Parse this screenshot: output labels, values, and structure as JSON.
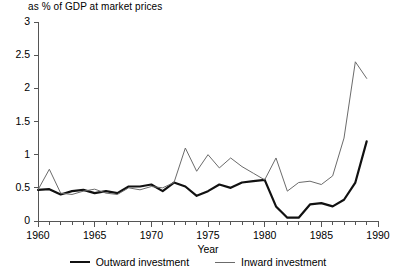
{
  "chart_data": {
    "type": "line",
    "title": "as % of GDP at market prices",
    "xlabel": "Year",
    "ylabel": "",
    "xlim": [
      1960,
      1990
    ],
    "ylim": [
      0,
      3
    ],
    "yticks": [
      "0",
      "0.5",
      "1",
      "1.5",
      "2",
      "2.5",
      "3"
    ],
    "ytick_values": [
      0,
      0.5,
      1,
      1.5,
      2,
      2.5,
      3
    ],
    "xticks": [
      "1960",
      "1965",
      "1970",
      "1975",
      "1980",
      "1985",
      "1990"
    ],
    "xtick_values": [
      1960,
      1965,
      1970,
      1975,
      1980,
      1985,
      1990
    ],
    "minor_xticks": "every year",
    "grid": false,
    "legend_position": "below",
    "x": [
      1960,
      1961,
      1962,
      1963,
      1964,
      1965,
      1966,
      1967,
      1968,
      1969,
      1970,
      1971,
      1972,
      1973,
      1974,
      1975,
      1976,
      1977,
      1978,
      1979,
      1980,
      1981,
      1982,
      1983,
      1984,
      1985,
      1986,
      1987,
      1988,
      1989
    ],
    "series": [
      {
        "name": "Outward investment",
        "color": "#111111",
        "width": 2.2,
        "values": [
          0.47,
          0.48,
          0.4,
          0.45,
          0.47,
          0.42,
          0.45,
          0.42,
          0.52,
          0.52,
          0.55,
          0.45,
          0.58,
          0.52,
          0.38,
          0.45,
          0.55,
          0.5,
          0.58,
          0.6,
          0.62,
          0.22,
          0.05,
          0.05,
          0.25,
          0.27,
          0.22,
          0.32,
          0.58,
          1.2
        ]
      },
      {
        "name": "Inward investment",
        "color": "#6b6b6b",
        "width": 1.0,
        "values": [
          0.47,
          0.78,
          0.42,
          0.4,
          0.45,
          0.48,
          0.42,
          0.4,
          0.5,
          0.47,
          0.52,
          0.5,
          0.58,
          1.1,
          0.75,
          1.0,
          0.8,
          0.95,
          0.82,
          0.72,
          0.62,
          0.95,
          0.45,
          0.58,
          0.6,
          0.55,
          0.68,
          1.25,
          2.4,
          2.15
        ]
      }
    ],
    "legend": [
      {
        "label": "Outward investment",
        "style": "thick-black-line"
      },
      {
        "label": "Inward investment",
        "style": "thin-grey-line"
      }
    ]
  }
}
